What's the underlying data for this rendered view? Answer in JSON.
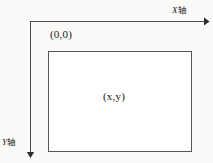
{
  "diagram": {
    "background_color": "#fbfaf8",
    "stroke_color": "#4a4a4a",
    "text_color": "#181818",
    "axes": {
      "x": {
        "label_italic": "X",
        "label_cjk": "轴",
        "direction": "right",
        "arrow": "arrow-right-icon",
        "line": {
          "x1": 30,
          "y1": 21.5,
          "x2": 206,
          "y2": 21.5
        }
      },
      "y": {
        "label_italic": "Y",
        "label_cjk": "轴",
        "direction": "down",
        "arrow": "arrow-down-icon",
        "line": {
          "x1": 30.5,
          "y1": 21,
          "x2": 30.5,
          "y2": 154
        }
      }
    },
    "origin": {
      "label": "(0,0)"
    },
    "rectangle": {
      "x": 48,
      "y": 51,
      "width": 144,
      "height": 101,
      "fill": "#ffffff",
      "stroke": "#585858",
      "point_label": "(x,y)"
    }
  }
}
